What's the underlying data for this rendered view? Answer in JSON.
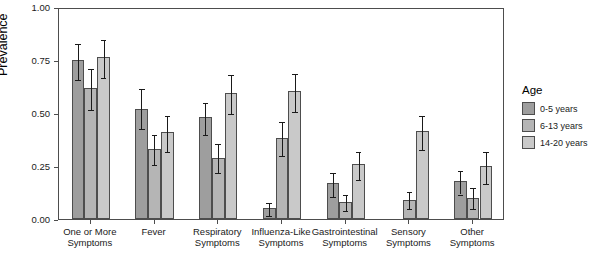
{
  "chart_data": {
    "type": "bar",
    "title": "",
    "xlabel": "",
    "ylabel": "Prevalence",
    "ylim": [
      0.0,
      1.0
    ],
    "ytick_labels": [
      "0.00",
      "0.25",
      "0.50",
      "0.75",
      "1.00"
    ],
    "ytick_values": [
      0.0,
      0.25,
      0.5,
      0.75,
      1.0
    ],
    "grid": false,
    "legend_position": "right",
    "categories": [
      "One or More\nSymptoms",
      "Fever",
      "Respiratory\nSymptoms",
      "Influenza-Like\nSymptoms",
      "Gastrointestinal\nSymptoms",
      "Sensory\nSymptoms",
      "Other\nSymptoms"
    ],
    "series": [
      {
        "name": "0-5 years",
        "color": "#9e9e9e",
        "values": [
          0.75,
          0.52,
          0.48,
          0.05,
          0.17,
          0.0,
          0.18
        ],
        "err_low": [
          0.665,
          0.435,
          0.405,
          0.025,
          0.115,
          0.0,
          0.125
        ],
        "err_high": [
          0.835,
          0.625,
          0.555,
          0.085,
          0.225,
          0.0,
          0.235
        ]
      },
      {
        "name": "6-13 years",
        "color": "#b5b5b5",
        "values": [
          0.62,
          0.33,
          0.29,
          0.38,
          0.08,
          0.09,
          0.1
        ],
        "err_low": [
          0.525,
          0.265,
          0.225,
          0.305,
          0.045,
          0.055,
          0.055
        ],
        "err_high": [
          0.715,
          0.405,
          0.365,
          0.465,
          0.125,
          0.135,
          0.155
        ]
      },
      {
        "name": "14-20 years",
        "color": "#c9c9c9",
        "values": [
          0.765,
          0.41,
          0.595,
          0.605,
          0.26,
          0.415,
          0.25
        ],
        "err_low": [
          0.675,
          0.325,
          0.505,
          0.515,
          0.195,
          0.335,
          0.175
        ],
        "err_high": [
          0.855,
          0.495,
          0.69,
          0.695,
          0.325,
          0.495,
          0.325
        ]
      }
    ]
  },
  "legend": {
    "title": "Age",
    "items": [
      {
        "label": "0-5 years",
        "color": "#9e9e9e"
      },
      {
        "label": "6-13 years",
        "color": "#b5b5b5"
      },
      {
        "label": "14-20 years",
        "color": "#c9c9c9"
      }
    ]
  }
}
